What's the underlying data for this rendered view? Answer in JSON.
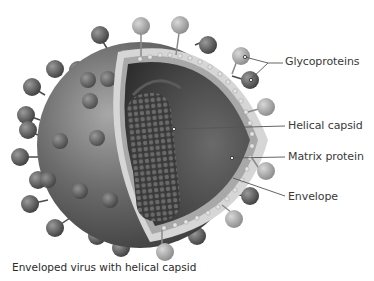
{
  "figure": {
    "caption": "Enveloped virus with helical capsid",
    "labels": [
      {
        "id": "glycoproteins",
        "text": "Glycoproteins",
        "x": 285,
        "y": 56
      },
      {
        "id": "helical-capsid",
        "text": "Helical capsid",
        "x": 288,
        "y": 118
      },
      {
        "id": "matrix-protein",
        "text": "Matrix protein",
        "x": 288,
        "y": 150
      },
      {
        "id": "envelope",
        "text": "Envelope",
        "x": 288,
        "y": 190
      }
    ],
    "colors": {
      "background": "#ffffff",
      "virus_body": "#6e6e6e",
      "spike_dark": "#5a5a5a",
      "spike_light": "#b8b8b8",
      "interior": "#4a4a4a",
      "membrane": "#d4d4d4",
      "leader_line": "#555555"
    }
  }
}
